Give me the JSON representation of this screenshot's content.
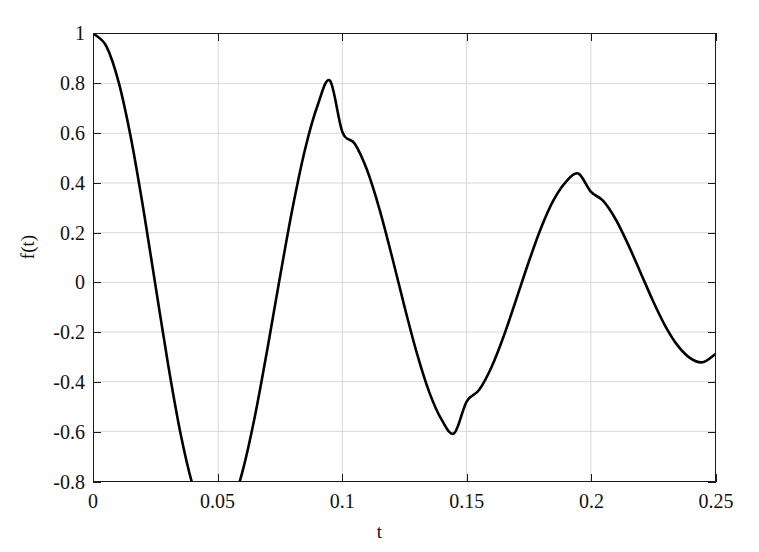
{
  "chart_data": {
    "type": "line",
    "title": "",
    "xlabel": "t",
    "ylabel": "f(t)",
    "xlim": [
      0,
      0.25
    ],
    "ylim": [
      -0.8,
      1
    ],
    "xticks": [
      "0",
      "0.05",
      "0.1",
      "0.15",
      "0.2",
      "0.25"
    ],
    "xtick_values": [
      0,
      0.05,
      0.1,
      0.15,
      0.2,
      0.25
    ],
    "yticks": [
      "1",
      "0.8",
      "0.6",
      "0.4",
      "0.2",
      "0",
      "-0.2",
      "-0.4",
      "-0.6",
      "-0.8"
    ],
    "ytick_values": [
      1,
      0.8,
      0.6,
      0.4,
      0.2,
      0,
      -0.2,
      -0.4,
      -0.6,
      -0.8
    ],
    "grid": true,
    "legend": null,
    "line_color": "#000000",
    "line_width": 2.6,
    "grid_color": "#d9d9d9",
    "axis_color": "#1a1a1a",
    "background": "#ffffff",
    "series": [
      {
        "name": "f(t)",
        "description": "damped cosine oscillation, decaying envelope",
        "x": [
          0,
          0.005,
          0.01,
          0.015,
          0.02,
          0.025,
          0.03,
          0.035,
          0.04,
          0.045,
          0.05,
          0.055,
          0.06,
          0.065,
          0.07,
          0.075,
          0.08,
          0.085,
          0.09,
          0.095,
          0.1,
          0.105,
          0.11,
          0.115,
          0.12,
          0.125,
          0.13,
          0.135,
          0.14,
          0.145,
          0.15,
          0.155,
          0.16,
          0.165,
          0.17,
          0.175,
          0.18,
          0.185,
          0.19,
          0.195,
          0.2,
          0.205,
          0.21,
          0.215,
          0.22,
          0.225,
          0.23,
          0.235,
          0.24,
          0.245,
          0.25
        ],
        "y": [
          1.0,
          0.95,
          0.803,
          0.574,
          0.287,
          -0.029,
          -0.341,
          -0.617,
          -0.826,
          -0.95,
          -0.978,
          -0.91,
          -0.753,
          -0.528,
          -0.257,
          0.029,
          0.302,
          0.537,
          0.712,
          0.812,
          0.605,
          0.558,
          0.45,
          0.292,
          0.102,
          -0.098,
          -0.286,
          -0.443,
          -0.554,
          -0.608,
          -0.48,
          -0.434,
          -0.342,
          -0.215,
          -0.068,
          0.082,
          0.22,
          0.331,
          0.405,
          0.438,
          0.365,
          0.328,
          0.254,
          0.153,
          0.04,
          -0.074,
          -0.176,
          -0.255,
          -0.305,
          -0.322,
          -0.29
        ],
        "key_points": [
          {
            "t": 0,
            "f": 1.0,
            "kind": "start"
          },
          {
            "t": 0.05,
            "f": -0.78,
            "kind": "minimum"
          },
          {
            "t": 0.1,
            "f": 0.605,
            "kind": "maximum"
          },
          {
            "t": 0.15,
            "f": -0.48,
            "kind": "minimum"
          },
          {
            "t": 0.2,
            "f": 0.365,
            "kind": "maximum"
          },
          {
            "t": 0.25,
            "f": -0.29,
            "kind": "end"
          }
        ]
      }
    ]
  },
  "axes": {
    "x_title": "t",
    "y_title": "f(t)"
  }
}
